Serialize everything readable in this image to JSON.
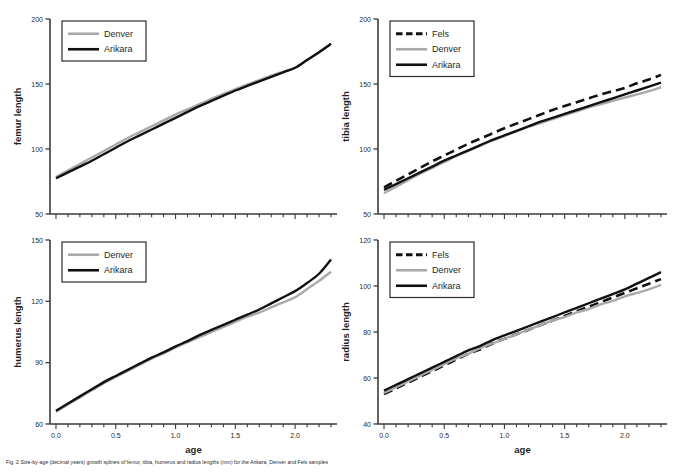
{
  "figure": {
    "caption": "Fig. 2 Size-by-age (decimal years) growth splines of femur, tibia, humerus and radius lengths (mm) for the Arikara, Denver and Fels samples"
  },
  "colors": {
    "arikara": "#111111",
    "denver": "#a9a9a9",
    "fels": "#111111",
    "axis": "#3a3a3a",
    "legend_border": "#2b2b2b",
    "background": "#ffffff"
  },
  "legend_names": {
    "fels": "Fels",
    "denver": "Denver",
    "arikara": "Arikara"
  },
  "chart_data": [
    {
      "type": "line",
      "panel": "top-left",
      "title": "",
      "xlabel": "",
      "ylabel": "femur length",
      "xlim": [
        -0.05,
        2.35
      ],
      "ylim": [
        50,
        200
      ],
      "xticks": [
        0.0,
        0.5,
        1.0,
        1.5,
        2.0
      ],
      "xticklabels": [
        "0.0",
        "0.5",
        "1.0",
        "1.5",
        "2.0"
      ],
      "xminortickstep": 0.1,
      "yticks": [
        50,
        100,
        150,
        200
      ],
      "yticklabels": [
        "50",
        "100",
        "150",
        "200"
      ],
      "grid": false,
      "legend_position": "top-left",
      "legend_entries": [
        "Denver",
        "Arikara"
      ],
      "x": [
        0.0,
        0.1,
        0.2,
        0.3,
        0.4,
        0.5,
        0.6,
        0.7,
        0.8,
        0.9,
        1.0,
        1.1,
        1.2,
        1.3,
        1.4,
        1.5,
        1.6,
        1.7,
        1.8,
        1.9,
        2.0,
        2.1,
        2.2,
        2.3
      ],
      "series": [
        {
          "name": "Denver",
          "style": "solid",
          "color": "#a9a9a9",
          "values": [
            78.5,
            83.5,
            88.5,
            93.5,
            98.5,
            103.5,
            108.5,
            113.0,
            117.5,
            122.0,
            126.5,
            130.5,
            134.5,
            138.5,
            142.5,
            146.0,
            149.5,
            153.0,
            156.5,
            159.5,
            162.5,
            168.5,
            174.5,
            180.5
          ]
        },
        {
          "name": "Arikara",
          "style": "solid",
          "color": "#111111",
          "values": [
            77.5,
            82.0,
            86.5,
            91.0,
            96.0,
            101.0,
            106.0,
            110.5,
            115.0,
            119.5,
            124.0,
            128.5,
            133.0,
            137.0,
            141.0,
            145.0,
            148.5,
            152.0,
            155.5,
            159.0,
            162.5,
            168.5,
            174.5,
            181.0
          ]
        }
      ]
    },
    {
      "type": "line",
      "panel": "top-right",
      "title": "",
      "xlabel": "",
      "ylabel": "tibia length",
      "xlim": [
        -0.05,
        2.35
      ],
      "ylim": [
        50,
        200
      ],
      "xticks": [
        0.0,
        0.5,
        1.0,
        1.5,
        2.0
      ],
      "xticklabels": [
        "0.0",
        "0.5",
        "1.0",
        "1.5",
        "2.0"
      ],
      "xminortickstep": 0.1,
      "yticks": [
        50,
        100,
        150,
        200
      ],
      "yticklabels": [
        "50",
        "100",
        "150",
        "200"
      ],
      "grid": false,
      "legend_position": "top-left",
      "legend_entries": [
        "Fels",
        "Denver",
        "Arikara"
      ],
      "x": [
        0.0,
        0.1,
        0.2,
        0.3,
        0.4,
        0.5,
        0.6,
        0.7,
        0.8,
        0.9,
        1.0,
        1.1,
        1.2,
        1.3,
        1.4,
        1.5,
        1.6,
        1.7,
        1.8,
        1.9,
        2.0,
        2.1,
        2.2,
        2.3
      ],
      "series": [
        {
          "name": "Fels",
          "style": "dashed",
          "color": "#111111",
          "values": [
            70.5,
            75.5,
            80.5,
            85.5,
            90.5,
            95.0,
            99.5,
            104.0,
            108.0,
            112.0,
            116.0,
            119.5,
            123.0,
            126.5,
            130.0,
            133.0,
            136.0,
            139.0,
            142.0,
            144.5,
            147.0,
            150.5,
            153.5,
            157.0
          ]
        },
        {
          "name": "Denver",
          "style": "solid",
          "color": "#a9a9a9",
          "values": [
            66.0,
            71.0,
            76.0,
            81.0,
            85.5,
            90.0,
            94.5,
            98.5,
            102.5,
            106.5,
            110.0,
            113.5,
            117.0,
            120.0,
            123.0,
            126.0,
            129.0,
            132.0,
            134.5,
            137.0,
            139.5,
            142.0,
            144.5,
            147.5
          ]
        },
        {
          "name": "Arikara",
          "style": "solid",
          "color": "#111111",
          "values": [
            68.5,
            73.0,
            77.5,
            82.0,
            86.5,
            91.0,
            95.0,
            99.0,
            103.0,
            107.0,
            110.5,
            114.0,
            117.5,
            121.0,
            124.0,
            127.0,
            130.0,
            133.0,
            136.0,
            139.0,
            142.0,
            145.0,
            148.0,
            151.0
          ]
        }
      ]
    },
    {
      "type": "line",
      "panel": "bottom-left",
      "title": "",
      "xlabel": "age",
      "ylabel": "humerus length",
      "xlim": [
        -0.05,
        2.35
      ],
      "ylim": [
        60,
        150
      ],
      "xticks": [
        0.0,
        0.5,
        1.0,
        1.5,
        2.0
      ],
      "xticklabels": [
        "0.0",
        "0.5",
        "1.0",
        "1.5",
        "2.0"
      ],
      "xminortickstep": 0.1,
      "yticks": [
        60,
        90,
        120,
        150
      ],
      "yticklabels": [
        "60",
        "90",
        "120",
        "150"
      ],
      "grid": false,
      "legend_position": "top-left",
      "legend_entries": [
        "Denver",
        "Arikara"
      ],
      "x": [
        0.0,
        0.1,
        0.2,
        0.3,
        0.4,
        0.5,
        0.6,
        0.7,
        0.8,
        0.9,
        1.0,
        1.1,
        1.2,
        1.3,
        1.4,
        1.5,
        1.6,
        1.7,
        1.8,
        1.9,
        2.0,
        2.1,
        2.2,
        2.3
      ],
      "series": [
        {
          "name": "Denver",
          "style": "solid",
          "color": "#a9a9a9",
          "values": [
            66.0,
            69.5,
            73.0,
            76.5,
            80.0,
            83.0,
            86.0,
            89.0,
            92.0,
            94.5,
            97.5,
            100.0,
            102.5,
            105.0,
            107.5,
            110.0,
            112.5,
            114.5,
            117.0,
            119.5,
            122.0,
            126.0,
            130.0,
            134.5
          ]
        },
        {
          "name": "Arikara",
          "style": "solid",
          "color": "#111111",
          "values": [
            66.5,
            70.0,
            73.5,
            77.0,
            80.5,
            83.5,
            86.5,
            89.5,
            92.5,
            95.0,
            98.0,
            100.5,
            103.5,
            106.0,
            108.5,
            111.0,
            113.5,
            116.0,
            119.0,
            122.0,
            125.0,
            129.0,
            133.5,
            140.5
          ]
        }
      ]
    },
    {
      "type": "line",
      "panel": "bottom-right",
      "title": "",
      "xlabel": "age",
      "ylabel": "radius length",
      "xlim": [
        -0.05,
        2.35
      ],
      "ylim": [
        40,
        120
      ],
      "xticks": [
        0.0,
        0.5,
        1.0,
        1.5,
        2.0
      ],
      "xticklabels": [
        "0.0",
        "0.5",
        "1.0",
        "1.5",
        "2.0"
      ],
      "xminortickstep": 0.1,
      "yticks": [
        40,
        60,
        80,
        100,
        120
      ],
      "yticklabels": [
        "40",
        "60",
        "80",
        "100",
        "120"
      ],
      "grid": false,
      "legend_position": "top-left",
      "legend_entries": [
        "Fels",
        "Denver",
        "Arikara"
      ],
      "x": [
        0.0,
        0.1,
        0.2,
        0.3,
        0.4,
        0.5,
        0.6,
        0.7,
        0.8,
        0.9,
        1.0,
        1.1,
        1.2,
        1.3,
        1.4,
        1.5,
        1.6,
        1.7,
        1.8,
        1.9,
        2.0,
        2.1,
        2.2,
        2.3
      ],
      "series": [
        {
          "name": "Fels",
          "style": "dashed",
          "color": "#111111",
          "values": [
            53.0,
            55.5,
            58.0,
            60.5,
            63.0,
            65.5,
            68.0,
            70.5,
            72.5,
            75.0,
            77.0,
            79.0,
            81.0,
            83.0,
            85.0,
            87.0,
            89.0,
            91.0,
            93.0,
            95.0,
            97.0,
            99.0,
            101.0,
            103.0
          ]
        },
        {
          "name": "Denver",
          "style": "solid",
          "color": "#a9a9a9",
          "values": [
            53.5,
            56.0,
            58.5,
            61.0,
            63.5,
            66.0,
            68.5,
            70.5,
            73.0,
            75.0,
            77.0,
            79.0,
            81.0,
            83.0,
            85.0,
            86.5,
            88.5,
            90.0,
            92.0,
            93.5,
            95.5,
            97.0,
            98.5,
            100.5
          ]
        },
        {
          "name": "Arikara",
          "style": "solid",
          "color": "#111111",
          "values": [
            54.5,
            57.0,
            59.5,
            62.0,
            64.5,
            67.0,
            69.5,
            72.0,
            74.0,
            76.5,
            78.5,
            80.5,
            82.5,
            84.5,
            86.5,
            88.5,
            90.5,
            92.5,
            94.5,
            96.5,
            98.5,
            101.0,
            103.5,
            106.0
          ]
        }
      ]
    }
  ]
}
